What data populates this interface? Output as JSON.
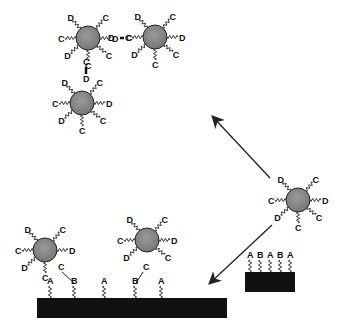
{
  "diagram": {
    "colors": {
      "particle_fill": "#8a8a8a",
      "particle_stroke": "#222222",
      "substrate": "#111111",
      "line": "#222222",
      "background": "#ffffff"
    },
    "particles": [
      {
        "id": "free",
        "cx": 298,
        "cy": 200,
        "ligands": [
          {
            "angle": -130,
            "label": "D"
          },
          {
            "angle": -50,
            "label": "C"
          },
          {
            "angle": 0,
            "label": "D"
          },
          {
            "angle": 40,
            "label": "C"
          },
          {
            "angle": 90,
            "label": "C"
          },
          {
            "angle": 140,
            "label": "D"
          },
          {
            "angle": 180,
            "label": "C"
          }
        ]
      },
      {
        "id": "cluster-1",
        "cx": 88,
        "cy": 38,
        "ligands": [
          {
            "angle": -130,
            "label": "D"
          },
          {
            "angle": -50,
            "label": "C"
          },
          {
            "angle": 0,
            "label": "D"
          },
          {
            "angle": 40,
            "label": "C"
          },
          {
            "angle": 90,
            "label": "C"
          },
          {
            "angle": 140,
            "label": "D"
          },
          {
            "angle": 180,
            "label": "C"
          }
        ]
      },
      {
        "id": "cluster-2",
        "cx": 155,
        "cy": 37,
        "ligands": [
          {
            "angle": -130,
            "label": "D"
          },
          {
            "angle": -50,
            "label": "C"
          },
          {
            "angle": 0,
            "label": "D"
          },
          {
            "angle": 40,
            "label": "C"
          },
          {
            "angle": 90,
            "label": "C"
          },
          {
            "angle": 140,
            "label": "D"
          },
          {
            "angle": 180,
            "label": "C"
          }
        ]
      },
      {
        "id": "cluster-3",
        "cx": 82,
        "cy": 103,
        "ligands": [
          {
            "angle": -130,
            "label": "D"
          },
          {
            "angle": -50,
            "label": "C"
          },
          {
            "angle": 0,
            "label": "D"
          },
          {
            "angle": 40,
            "label": "C"
          },
          {
            "angle": 90,
            "label": "C"
          },
          {
            "angle": 140,
            "label": "D"
          },
          {
            "angle": 180,
            "label": "C"
          }
        ]
      },
      {
        "id": "bound-1",
        "cx": 45,
        "cy": 250,
        "ligands": [
          {
            "angle": -130,
            "label": "D"
          },
          {
            "angle": -50,
            "label": "C"
          },
          {
            "angle": 0,
            "label": "D"
          },
          {
            "angle": 90,
            "label": "C"
          },
          {
            "angle": 140,
            "label": "D"
          },
          {
            "angle": 180,
            "label": "C"
          }
        ]
      },
      {
        "id": "bound-2",
        "cx": 147,
        "cy": 240,
        "ligands": [
          {
            "angle": -130,
            "label": "D"
          },
          {
            "angle": -50,
            "label": "C"
          },
          {
            "angle": 0,
            "label": "D"
          },
          {
            "angle": 40,
            "label": "C"
          },
          {
            "angle": 140,
            "label": "D"
          },
          {
            "angle": 180,
            "label": "C"
          }
        ]
      }
    ],
    "bonds": [
      {
        "label_left": "D",
        "label_right": "C",
        "note": "D=C crosslink between cluster-1 and cluster-2"
      },
      {
        "label_top": "C",
        "label_bottom": "D",
        "note": "C=D crosslink between cluster-1 and cluster-3"
      }
    ],
    "small_substrate": {
      "labels": [
        "A",
        "B",
        "A",
        "B",
        "A"
      ]
    },
    "large_substrate": {
      "labels": [
        "A",
        "B",
        "A",
        "B",
        "A"
      ],
      "bound_tether_labels": [
        "C",
        "C"
      ]
    },
    "arrows": [
      {
        "name": "to-crosslinked-cluster"
      },
      {
        "name": "to-surface-binding"
      }
    ]
  }
}
